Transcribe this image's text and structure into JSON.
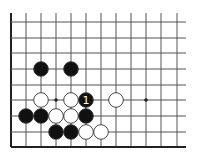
{
  "diagram": {
    "type": "go-board-fragment",
    "colors": {
      "background": "#ffffff",
      "line": "#555555",
      "edge": "#222222",
      "black_stone": "#111111",
      "white_stone": "#ffffff",
      "stone_outline": "#333333"
    },
    "grid": {
      "columns_x": [
        11,
        26,
        41,
        56,
        71,
        86,
        101,
        116,
        131,
        146,
        161,
        177
      ],
      "rows_y": [
        22,
        38,
        53,
        69,
        85,
        100,
        116,
        132,
        147
      ],
      "top_open_to_y": 13,
      "right_open_to_x": 186,
      "edges": [
        "left",
        "bottom"
      ]
    },
    "star_points": [
      {
        "col": 3,
        "row": 5
      },
      {
        "col": 9,
        "row": 5
      }
    ],
    "stones": [
      {
        "color": "black",
        "col": 2,
        "row": 3
      },
      {
        "color": "black",
        "col": 4,
        "row": 3
      },
      {
        "color": "white",
        "col": 2,
        "row": 5
      },
      {
        "color": "white",
        "col": 4,
        "row": 5
      },
      {
        "color": "black",
        "col": 5,
        "row": 5,
        "label": "1"
      },
      {
        "color": "white",
        "col": 7,
        "row": 5
      },
      {
        "color": "black",
        "col": 1,
        "row": 6
      },
      {
        "color": "black",
        "col": 2,
        "row": 6
      },
      {
        "color": "white",
        "col": 3,
        "row": 6
      },
      {
        "color": "white",
        "col": 4,
        "row": 6
      },
      {
        "color": "black",
        "col": 5,
        "row": 6
      },
      {
        "color": "black",
        "col": 3,
        "row": 7
      },
      {
        "color": "black",
        "col": 4,
        "row": 7
      },
      {
        "color": "white",
        "col": 5,
        "row": 7
      },
      {
        "color": "white",
        "col": 6,
        "row": 7
      }
    ],
    "stone_radius": 7.3
  }
}
